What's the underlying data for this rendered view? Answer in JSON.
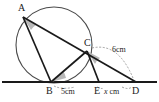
{
  "figure": {
    "background_color": "#ffffff",
    "stroke_color": "#1a1a1a",
    "circle_stroke_color": "#4a4a4a",
    "angle_fill_color": "#b9b9b9",
    "dash_color": "#8a8a8a",
    "points": [
      {
        "name": "A",
        "label": "A",
        "x": 23,
        "y": 17,
        "label_x": 18,
        "label_y": 3
      },
      {
        "name": "B",
        "label": "B",
        "x": 51,
        "y": 82,
        "label_x": 46,
        "label_y": 87
      },
      {
        "name": "C",
        "label": "C",
        "x": 87,
        "y": 51,
        "label_x": 84,
        "label_y": 38
      },
      {
        "name": "E",
        "label": "E",
        "x": 99,
        "y": 82,
        "label_x": 94,
        "label_y": 87
      },
      {
        "name": "D",
        "label": "D",
        "x": 136,
        "y": 82,
        "label_x": 133,
        "label_y": 87
      }
    ],
    "segments": [
      {
        "name": "segment-A-B",
        "from": "A",
        "to": "B"
      },
      {
        "name": "segment-A-D",
        "from": "A",
        "to": "D"
      },
      {
        "name": "segment-B-C",
        "from": "B",
        "to": "C"
      },
      {
        "name": "segment-C-E",
        "from": "C",
        "to": "E"
      },
      {
        "name": "baseline-B-D",
        "from": "B",
        "to": "D"
      }
    ],
    "circle": {
      "cx": 54,
      "cy": 45,
      "r": 38
    },
    "baseline": {
      "x1": 2,
      "y1": 82,
      "x2": 157,
      "y2": 82
    },
    "angle_marks": [
      {
        "name": "angle-at-A",
        "vertex": "A"
      },
      {
        "name": "angle-at-B",
        "vertex": "B"
      },
      {
        "name": "angle-at-C",
        "vertex": "C"
      }
    ],
    "measures": [
      {
        "name": "measure-BE",
        "text": "5cm",
        "x": 65,
        "y": 89,
        "between": "B-E"
      },
      {
        "name": "measure-ED",
        "prefix": "x",
        "suffix": " cm",
        "x": 107,
        "y": 89,
        "between": "E-D"
      },
      {
        "name": "measure-CD",
        "text": "6cm",
        "x": 113,
        "y": 50,
        "between": "C-D"
      }
    ]
  }
}
